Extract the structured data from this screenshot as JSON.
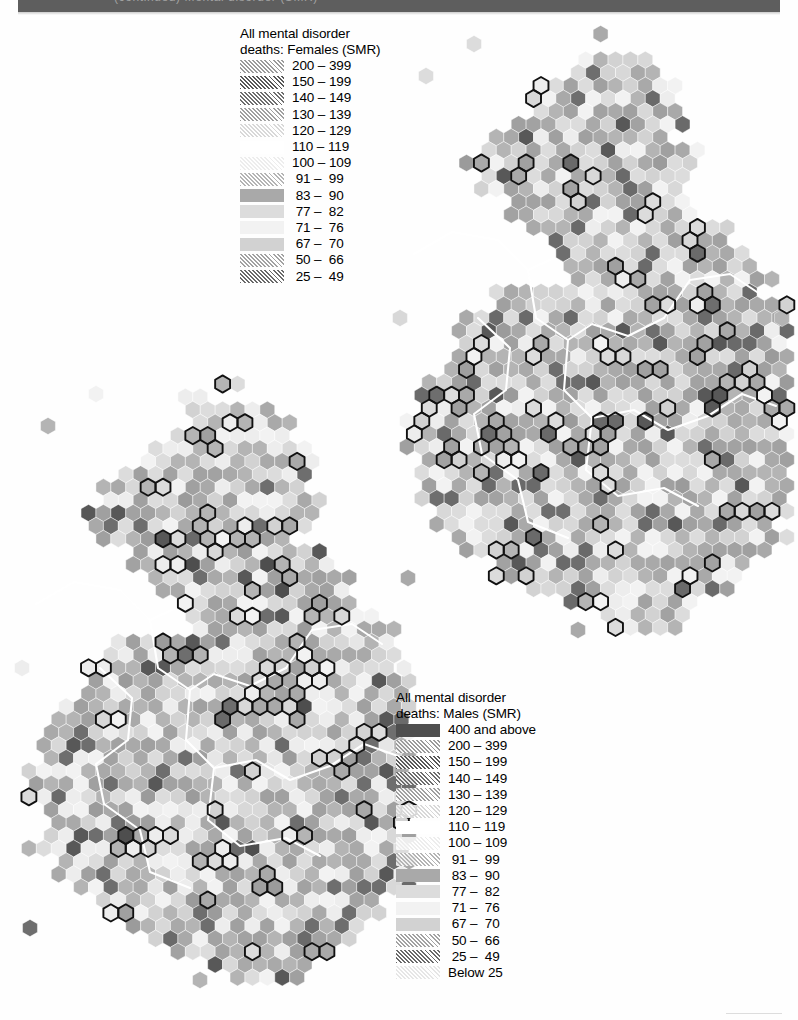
{
  "page": {
    "header_text": "(continued) Mental disorder (SMR)",
    "header_bg": "#5e5e5e",
    "background": "#ffffff"
  },
  "legend_females": {
    "title": "All mental disorder\ndeaths: Females (SMR)",
    "rows": [
      {
        "label": "200 – 399",
        "fill": "#9b9b9b",
        "hatch": "diag",
        "blank": false
      },
      {
        "label": "150 – 199",
        "fill": "#585858",
        "hatch": "diag",
        "blank": false
      },
      {
        "label": "140 – 149",
        "fill": "#6e6e6e",
        "hatch": "diag",
        "blank": false
      },
      {
        "label": "130 – 139",
        "fill": "#a0a0a0",
        "hatch": "diag",
        "blank": false
      },
      {
        "label": "120 – 129",
        "fill": "#d8d8d8",
        "hatch": "diag",
        "blank": false
      },
      {
        "label": "110 – 119",
        "fill": "#ffffff",
        "hatch": "none",
        "blank": true
      },
      {
        "label": "100 – 109",
        "fill": "#ededed",
        "hatch": "diag",
        "blank": false
      },
      {
        "label": " 91 –  99",
        "fill": "#b4b4b4",
        "hatch": "diag",
        "blank": false
      },
      {
        "label": " 83 –  90",
        "fill": "#a9a9a9",
        "hatch": "none",
        "blank": false
      },
      {
        "label": " 77 –  82",
        "fill": "#dcdcdc",
        "hatch": "none",
        "blank": false
      },
      {
        "label": " 71 –  76",
        "fill": "#f2f2f2",
        "hatch": "none",
        "blank": false
      },
      {
        "label": " 67 –  70",
        "fill": "#d2d2d2",
        "hatch": "none",
        "blank": false
      },
      {
        "label": " 50 –  66",
        "fill": "#a2a2a2",
        "hatch": "diag",
        "blank": false
      },
      {
        "label": " 25 –  49",
        "fill": "#6a6a6a",
        "hatch": "diag",
        "blank": false
      }
    ]
  },
  "legend_males": {
    "title": "All mental disorder\ndeaths: Males (SMR)",
    "rows": [
      {
        "label": "400 and above",
        "fill": "#4e4e4e",
        "hatch": "none",
        "blank": false
      },
      {
        "label": "200 – 399",
        "fill": "#9b9b9b",
        "hatch": "diag",
        "blank": false
      },
      {
        "label": "150 – 199",
        "fill": "#585858",
        "hatch": "diag",
        "blank": false
      },
      {
        "label": "140 – 149",
        "fill": "#6e6e6e",
        "hatch": "diag",
        "blank": false
      },
      {
        "label": "130 – 139",
        "fill": "#a0a0a0",
        "hatch": "diag",
        "blank": false
      },
      {
        "label": "120 – 129",
        "fill": "#d8d8d8",
        "hatch": "diag",
        "blank": false
      },
      {
        "label": "110 – 119",
        "fill": "#ffffff",
        "hatch": "none",
        "blank": true
      },
      {
        "label": "100 – 109",
        "fill": "#ededed",
        "hatch": "diag",
        "blank": false
      },
      {
        "label": " 91 –  99",
        "fill": "#b4b4b4",
        "hatch": "diag",
        "blank": false
      },
      {
        "label": " 83 –  90",
        "fill": "#a9a9a9",
        "hatch": "none",
        "blank": false
      },
      {
        "label": " 77 –  82",
        "fill": "#dcdcdc",
        "hatch": "none",
        "blank": false
      },
      {
        "label": " 71 –  76",
        "fill": "#f2f2f2",
        "hatch": "none",
        "blank": false
      },
      {
        "label": " 67 –  70",
        "fill": "#d2d2d2",
        "hatch": "none",
        "blank": false
      },
      {
        "label": " 50 –  66",
        "fill": "#a2a2a2",
        "hatch": "diag",
        "blank": false
      },
      {
        "label": " 25 –  49",
        "fill": "#6a6a6a",
        "hatch": "diag",
        "blank": false
      },
      {
        "label": "Below 25",
        "fill": "#e6e6e6",
        "hatch": "diag",
        "blank": false
      }
    ]
  },
  "chart_data": {
    "type": "map",
    "subtype": "hexagonal-cartogram",
    "panels": [
      {
        "name": "females",
        "title": "All mental disorder deaths: Females (SMR)",
        "measure": "SMR",
        "sex": "Females",
        "legend_ref": "legend_females",
        "class_breaks": [
          25,
          50,
          67,
          71,
          77,
          83,
          91,
          100,
          110,
          120,
          130,
          140,
          150,
          200,
          400
        ],
        "class_labels": [
          "200 – 399",
          "150 – 199",
          "140 – 149",
          "130 – 139",
          "120 – 129",
          "110 – 119",
          "100 – 109",
          "91 – 99",
          "83 – 90",
          "77 – 82",
          "71 – 76",
          "67 – 70",
          "50 – 66",
          "25 – 49"
        ],
        "n_hexes": 641,
        "boundary_overlay": "black outlines mark metropolitan / grouped constituency areas; white outlines mark region boundaries"
      },
      {
        "name": "males",
        "title": "All mental disorder deaths: Males (SMR)",
        "measure": "SMR",
        "sex": "Males",
        "legend_ref": "legend_males",
        "class_breaks": [
          0,
          25,
          50,
          67,
          71,
          77,
          83,
          91,
          100,
          110,
          120,
          130,
          140,
          150,
          200,
          400
        ],
        "class_labels": [
          "400 and above",
          "200 – 399",
          "150 – 199",
          "140 – 149",
          "130 – 139",
          "120 – 129",
          "110 – 119",
          "100 – 109",
          "91 – 99",
          "83 – 90",
          "77 – 82",
          "71 – 76",
          "67 – 70",
          "50 – 66",
          "25 – 49",
          "Below 25"
        ],
        "n_hexes": 641,
        "boundary_overlay": "black outlines mark metropolitan / grouped constituency areas; white outlines mark region boundaries"
      }
    ],
    "legend_position": "females legend top-centre-left; males legend lower-right",
    "grid": false
  }
}
